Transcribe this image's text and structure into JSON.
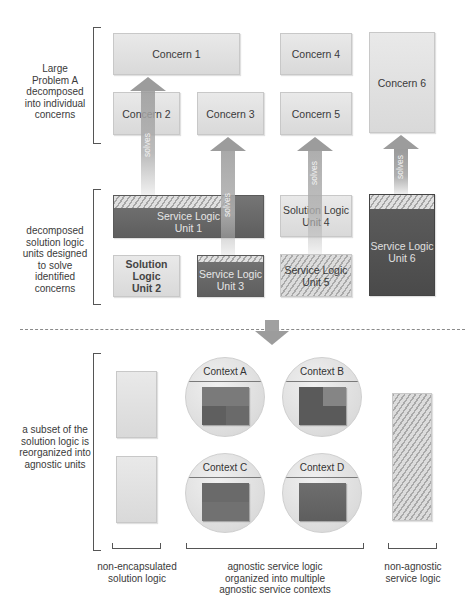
{
  "top_section": {
    "bracket_label": "Large Problem A decomposed into individual concerns",
    "bracket_label_lines": [
      "Large",
      "Problem A",
      "decomposed",
      "into individual",
      "concerns"
    ],
    "concerns": [
      {
        "id": 1,
        "label": "Concern 1"
      },
      {
        "id": 2,
        "label": "Concern 2"
      },
      {
        "id": 3,
        "label": "Concern 3"
      },
      {
        "id": 4,
        "label": "Concern 4"
      },
      {
        "id": 5,
        "label": "Concern 5"
      },
      {
        "id": 6,
        "label": "Concern 6"
      }
    ]
  },
  "middle_section": {
    "bracket_label_lines": [
      "decomposed",
      "solution logic",
      "units designed",
      "to solve",
      "identified",
      "concerns"
    ],
    "units": [
      {
        "id": 1,
        "line1": "Service Logic",
        "line2": "Unit 1",
        "style": "dark-partial-hatch"
      },
      {
        "id": 2,
        "line1": "Solution Logic",
        "line2": "Unit 2",
        "style": "light"
      },
      {
        "id": 3,
        "line1": "Service Logic",
        "line2": "Unit 3",
        "style": "dark-partial-hatch"
      },
      {
        "id": 4,
        "line1": "Solution Logic",
        "line2": "Unit 4",
        "style": "light"
      },
      {
        "id": 5,
        "line1": "Service Logic",
        "line2": "Unit 5",
        "style": "hatched"
      },
      {
        "id": 6,
        "line1": "Service Logic",
        "line2": "Unit 6",
        "style": "darker-partial-hatch"
      }
    ],
    "arrow_label": "solves"
  },
  "bottom_section": {
    "bracket_label_lines": [
      "a subset of the",
      "solution logic is",
      "reorganized into",
      "agnostic units"
    ],
    "contexts": [
      {
        "label": "Context A"
      },
      {
        "label": "Context B"
      },
      {
        "label": "Context C"
      },
      {
        "label": "Context D"
      }
    ],
    "captions": {
      "non_encapsulated": [
        "non-encapsulated",
        "solution logic"
      ],
      "agnostic": [
        "agnostic service logic",
        "organized into multiple",
        "agnostic service contexts"
      ],
      "non_agnostic": [
        "non-agnostic",
        "service logic"
      ]
    }
  },
  "colors": {
    "light_box": "#e0e0e0",
    "dark_box": "#676767",
    "darker_box": "#535353",
    "arrow": "#9c9c9c",
    "line": "#555555"
  }
}
